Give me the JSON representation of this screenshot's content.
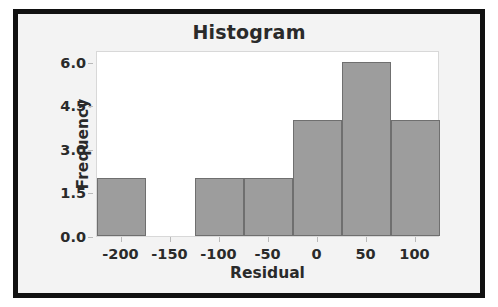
{
  "chart_data": {
    "type": "bar",
    "title": "Histogram",
    "xlabel": "Residual",
    "ylabel": "Frequency",
    "grid": false,
    "legend": null,
    "bin_width": 50,
    "bin_edges": [
      -225,
      -175,
      -125,
      -75,
      -25,
      25,
      75,
      125
    ],
    "bin_centers": [
      -200,
      -150,
      -100,
      -50,
      0,
      50,
      100
    ],
    "values": [
      2,
      0,
      2,
      2,
      4,
      6,
      4
    ],
    "categories": [
      "-225 to -175",
      "-175 to -125",
      "-125 to -75",
      "-75 to -25",
      "-25 to 25",
      "25 to 75",
      "75 to 125"
    ],
    "xlim": [
      -225,
      125
    ],
    "ylim": [
      0,
      6.4
    ],
    "xticks": [
      -200,
      -150,
      -100,
      -50,
      0,
      50,
      100
    ],
    "xtick_labels": [
      "-200",
      "-150",
      "-100",
      "-50",
      "0",
      "50",
      "100"
    ],
    "yticks": [
      0.0,
      1.5,
      3.0,
      4.5,
      6.0
    ],
    "ytick_labels": [
      "0.0",
      "1.5",
      "3.0",
      "4.5",
      "6.0"
    ],
    "bar_color": "#9d9d9d",
    "bar_edge_color": "#6f6f6f",
    "plot_background": "#ffffff",
    "figure_background": "#f3f3f3",
    "frame_color": "#111111"
  }
}
